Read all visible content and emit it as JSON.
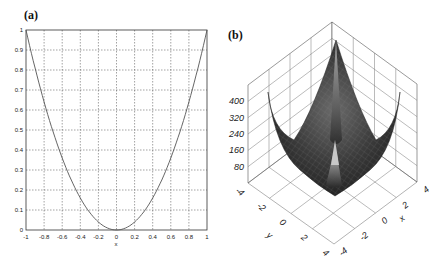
{
  "panels": {
    "a": {
      "label": "(a)"
    },
    "b": {
      "label": "(b)"
    }
  },
  "chart_data": [
    {
      "type": "line",
      "panel": "(a)",
      "title": "",
      "xlabel": "x",
      "ylabel": "",
      "xlim": [
        -1,
        1
      ],
      "ylim": [
        0,
        1
      ],
      "grid": true,
      "grid_style": "dashed",
      "x_ticks": [
        "-1",
        "-0.8",
        "-0.6",
        "-0.4",
        "-0.2",
        "0",
        "0.2",
        "0.4",
        "0.6",
        "0.8",
        "1"
      ],
      "y_ticks": [
        "0",
        "0.1",
        "0.2",
        "0.3",
        "0.4",
        "0.5",
        "0.6",
        "0.7",
        "0.8",
        "0.9",
        "1"
      ],
      "series": [
        {
          "name": "f(x)=x^2",
          "x": [
            -1,
            -0.9,
            -0.8,
            -0.7,
            -0.6,
            -0.5,
            -0.4,
            -0.3,
            -0.2,
            -0.1,
            0,
            0.1,
            0.2,
            0.3,
            0.4,
            0.5,
            0.6,
            0.7,
            0.8,
            0.9,
            1
          ],
          "y": [
            1,
            0.81,
            0.64,
            0.49,
            0.36,
            0.25,
            0.16,
            0.09,
            0.04,
            0.01,
            0,
            0.01,
            0.04,
            0.09,
            0.16,
            0.25,
            0.36,
            0.49,
            0.64,
            0.81,
            1
          ]
        }
      ]
    },
    {
      "type": "surface",
      "panel": "(b)",
      "title": "",
      "xlabel": "x",
      "ylabel": "y",
      "zlabel": "",
      "xlim": [
        -4,
        4
      ],
      "ylim": [
        -4,
        4
      ],
      "zlim": [
        0,
        480
      ],
      "x_ticks": [
        "-4",
        "-2",
        "0",
        "2",
        "4"
      ],
      "y_ticks": [
        "-4",
        "-2",
        "0",
        "2",
        "4"
      ],
      "z_ticks": [
        "80",
        "160",
        "240",
        "320",
        "400"
      ],
      "grid": true,
      "description": "Bowl-shaped mesh surface with sharp peaks at the four corners (~400+) and a small central spike; minimum near the bowl floor"
    }
  ],
  "axes_text": {
    "a_xlabel": "x",
    "b_xlabel": "x",
    "b_ylabel": "y"
  }
}
